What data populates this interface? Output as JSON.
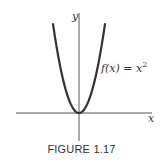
{
  "chart_data": {
    "type": "line",
    "title": "",
    "function_label": "f(x) = x^2",
    "function_label_parts": {
      "lhs": "f(x) = x",
      "exponent": "2"
    },
    "xlabel": "x",
    "ylabel": "y",
    "grid": false,
    "legend": "none",
    "x": [
      -2,
      -1.5,
      -1,
      -0.5,
      0,
      0.5,
      1,
      1.5,
      2
    ],
    "series": [
      {
        "name": "f(x) = x^2",
        "values": [
          4,
          2.25,
          1,
          0.25,
          0,
          0.25,
          1,
          2.25,
          4
        ]
      }
    ],
    "xlim": [
      -5.2,
      5.2
    ],
    "ylim": [
      -2,
      5
    ]
  },
  "caption": "FIGURE 1.17",
  "colors": {
    "curve": "#333333",
    "axes": "#555555",
    "text": "#333333"
  }
}
